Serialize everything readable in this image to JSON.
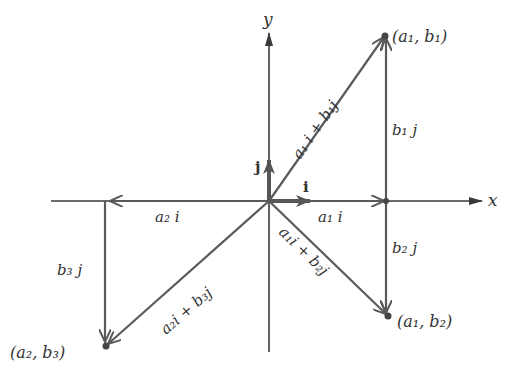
{
  "diagram": {
    "type": "vector-decomposition",
    "colors": {
      "axis": "#3a3a3a",
      "vector": "#5a5a5a",
      "text": "#333333",
      "background": "#ffffff"
    },
    "axes": {
      "x_label": "x",
      "y_label": "y"
    },
    "unit_vectors": {
      "i_label": "i",
      "j_label": "j"
    },
    "points": [
      {
        "id": "p1",
        "label": "(a₁, b₁)"
      },
      {
        "id": "p2",
        "label": "(a₁, b₂)"
      },
      {
        "id": "p3",
        "label": "(a₂, b₃)"
      }
    ],
    "vector_labels": {
      "a1i_plus_b1j": "a₁ i + b₁j",
      "b1j": "b₁ j",
      "a1i": "a₁ i",
      "b2j": "b₂ j",
      "a1i_plus_b2j": "a₁i + b₂j",
      "a2i": "a₂ i",
      "b3j": "b₃ j",
      "a2i_plus_b3j": "a₂i + b₃j"
    }
  }
}
